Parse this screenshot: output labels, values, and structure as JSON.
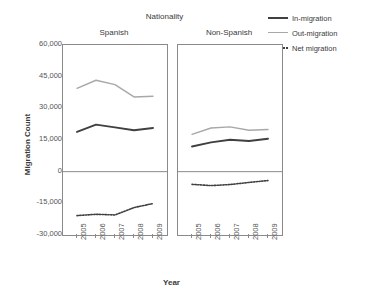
{
  "chart_data": {
    "type": "line",
    "title": "Nationality",
    "xlabel": "Year",
    "ylabel": "Migration Count",
    "x": [
      "2005",
      "2006",
      "2007",
      "2008",
      "2009"
    ],
    "ylim": [
      -30000,
      60000
    ],
    "yticks": [
      "60,000",
      "45,000",
      "30,000",
      "15,000",
      "0",
      "-15,000",
      "-30,000"
    ],
    "ytick_values": [
      60000,
      45000,
      30000,
      15000,
      0,
      -15000,
      -30000
    ],
    "grid": false,
    "legend_position": "top-right",
    "legend": [
      "In-migration",
      "Out-migration",
      "Net migration"
    ],
    "facet_label": "Nationality",
    "facets": [
      {
        "name": "Spanish",
        "series": [
          {
            "name": "In-migration",
            "style": "solid-dark",
            "values": [
              18800,
              22300,
              21000,
              19600,
              20700
            ]
          },
          {
            "name": "Out-migration",
            "style": "solid-gray",
            "values": [
              39500,
              43300,
              41200,
              35400,
              35700
            ]
          },
          {
            "name": "Net migration",
            "style": "dotted",
            "values": [
              -20800,
              -20200,
              -20500,
              -17000,
              -15100
            ]
          }
        ]
      },
      {
        "name": "Non-Spanish",
        "series": [
          {
            "name": "In-migration",
            "style": "solid-dark",
            "values": [
              11900,
              13900,
              15100,
              14500,
              15600
            ]
          },
          {
            "name": "Out-migration",
            "style": "solid-gray",
            "values": [
              17700,
              20700,
              21200,
              19600,
              20000
            ]
          },
          {
            "name": "Net migration",
            "style": "dotted",
            "values": [
              -6000,
              -6600,
              -6100,
              -5100,
              -4200
            ]
          }
        ]
      }
    ],
    "colors": {
      "in_migration": "#404040",
      "out_migration": "#a8a8a8",
      "net_migration": "#404040",
      "axis": "#8a8a8a",
      "text": "#3a3a3a",
      "background": "#ffffff"
    }
  }
}
